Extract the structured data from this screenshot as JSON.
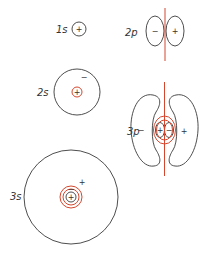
{
  "diagram": {
    "colors": {
      "outline": "#3a3a3a",
      "node": "#d4472e",
      "background": "#ffffff"
    },
    "orbitals": [
      {
        "id": "1s",
        "label": "1s",
        "signs": [
          "+"
        ]
      },
      {
        "id": "2p",
        "label": "2p",
        "signs": [
          "−",
          "+"
        ]
      },
      {
        "id": "2s",
        "label": "2s",
        "signs": [
          "−",
          "+"
        ]
      },
      {
        "id": "3p",
        "label": "3p",
        "signs": [
          "−",
          "+",
          "+",
          "−"
        ]
      },
      {
        "id": "3s",
        "label": "3s",
        "signs": [
          "+",
          "−",
          "+"
        ]
      }
    ]
  }
}
